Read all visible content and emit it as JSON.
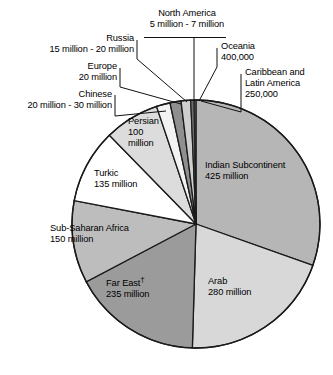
{
  "chart_data": {
    "type": "pie",
    "title": "",
    "subtitle": "",
    "xlabel": "",
    "ylabel": "",
    "legend_position": "none",
    "grid": false,
    "units": "people",
    "note_symbol": "†",
    "total_label": "",
    "slices": [
      {
        "name": "Indian Subcontinent",
        "label_lines": [
          "Indian Subcontinent",
          "425 million"
        ],
        "value": 425,
        "value_text": "425 million",
        "share_pct": 30.5,
        "fill": "#b6b6b6"
      },
      {
        "name": "Arab",
        "label_lines": [
          "Arab",
          "280 million"
        ],
        "value": 280,
        "value_text": "280 million",
        "share_pct": 20.1,
        "fill": "#d8d8d8"
      },
      {
        "name": "Far East",
        "label_lines": [
          "Far East",
          "235 million"
        ],
        "value": 235,
        "value_text": "235 million",
        "share_pct": 16.9,
        "fill": "#9b9b9b",
        "has_dagger": true
      },
      {
        "name": "Sub-Saharan Africa",
        "label_lines": [
          "Sub-Saharan Africa",
          "150 million"
        ],
        "value": 150,
        "value_text": "150 million",
        "share_pct": 10.8,
        "fill": "#bdbdbd"
      },
      {
        "name": "Turkic",
        "label_lines": [
          "Turkic",
          "135 million"
        ],
        "value": 135,
        "value_text": "135 million",
        "share_pct": 9.7,
        "fill": "#ffffff"
      },
      {
        "name": "Persian",
        "label_lines": [
          "Persian",
          "100",
          "million"
        ],
        "value": 100,
        "value_text": "100 million",
        "share_pct": 7.2,
        "fill": "#dcdcdc"
      },
      {
        "name": "Chinese",
        "label_lines": [
          "Chinese",
          "20 million - 30 million"
        ],
        "value": 25,
        "value_text": "20 million - 30 million",
        "share_pct": 1.8,
        "fill": "#f2f2f2"
      },
      {
        "name": "Europe",
        "label_lines": [
          "Europe",
          "20 million"
        ],
        "value": 20,
        "value_text": "20 million",
        "share_pct": 1.4,
        "fill": "#8f8f8f"
      },
      {
        "name": "Russia",
        "label_lines": [
          "Russia",
          "15 million - 20 million"
        ],
        "value": 17.5,
        "value_text": "15 million - 20 million",
        "share_pct": 1.3,
        "fill": "#cfcfcf"
      },
      {
        "name": "North America",
        "label_lines": [
          "North America",
          "5 million - 7 million"
        ],
        "value": 6,
        "value_text": "5 million - 7 million",
        "share_pct": 0.43,
        "fill": "#6e6e6e"
      },
      {
        "name": "Oceania",
        "label_lines": [
          "Oceania",
          "400,000"
        ],
        "value": 0.4,
        "value_text": "400,000",
        "share_pct": 0.029,
        "fill": "#c8c8c8"
      },
      {
        "name": "Caribbean and Latin America",
        "label_lines": [
          "Caribbean and",
          "Latin America",
          "250,000"
        ],
        "value": 0.25,
        "value_text": "250,000",
        "share_pct": 0.018,
        "fill": "#a0a0a0"
      }
    ]
  },
  "labels": {
    "north_america": {
      "line1": "North America",
      "line2": "5 million - 7 million"
    },
    "russia": {
      "line1": "Russia",
      "line2": "15 million - 20 million"
    },
    "europe": {
      "line1": "Europe",
      "line2": "20 million"
    },
    "chinese": {
      "line1": "Chinese",
      "line2": "20 million - 30 million"
    },
    "oceania": {
      "line1": "Oceania",
      "line2": "400,000"
    },
    "caribbean": {
      "line1": "Caribbean and",
      "line2": "Latin America",
      "line3": "250,000"
    },
    "persian": {
      "line1": "Persian",
      "line2": "100",
      "line3": "million"
    },
    "turkic": {
      "line1": "Turkic",
      "line2": "135 million"
    },
    "subsaharan": {
      "line1": "Sub-Saharan Africa",
      "line2": "150 million"
    },
    "fareast": {
      "line1": "Far East",
      "dagger": "†",
      "line2": "235 million"
    },
    "indian": {
      "line1": "Indian Subcontinent",
      "line2": "425 million"
    },
    "arab": {
      "line1": "Arab",
      "line2": "280 million"
    }
  }
}
